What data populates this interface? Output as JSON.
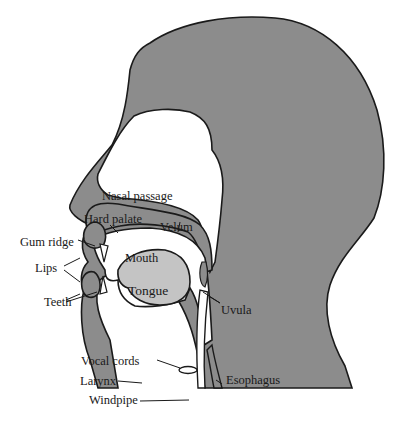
{
  "diagram": {
    "type": "anatomical-cross-section",
    "colors": {
      "background": "#ffffff",
      "tissue": "#8c8c8c",
      "tongue": "#c4c4c4",
      "outline": "#1a1a1a",
      "airway": "#ffffff"
    },
    "labels": {
      "nasal_passage": "Nasal passage",
      "hard_palate": "Hard palate",
      "velum": "Velum",
      "gum_ridge": "Gum ridge",
      "mouth": "Mouth",
      "lips": "Lips",
      "tongue": "Tongue",
      "teeth": "Teeth",
      "uvula": "Uvula",
      "vocal_cords": "Vocal cords",
      "larynx": "Larynx",
      "esophagus": "Esophagus",
      "windpipe": "Windpipe"
    }
  }
}
